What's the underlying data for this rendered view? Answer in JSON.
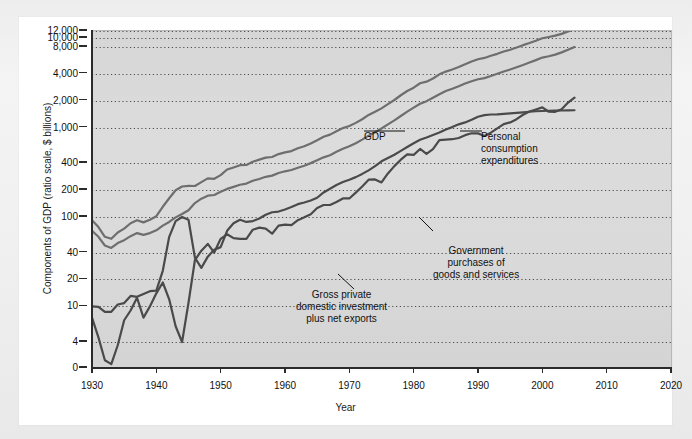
{
  "figure": {
    "y_axis_title": "Components of GDP (ratio scale, $ billions)",
    "x_axis_title": "Year"
  },
  "chart_data": {
    "type": "line",
    "title": "",
    "xlabel": "Year",
    "ylabel": "Components of GDP (ratio scale, $ billions)",
    "scale": "log",
    "grid": true,
    "legend_position": "inline-annotations",
    "xlim": [
      1930,
      2020
    ],
    "xticks": [
      1930,
      1940,
      1950,
      1960,
      1970,
      1980,
      1990,
      2000,
      2010,
      2020
    ],
    "yticks": [
      0,
      4,
      10,
      20,
      40,
      100,
      200,
      400,
      1000,
      2000,
      4000,
      8000,
      10000,
      12000
    ],
    "ytick_labels": [
      "0",
      "4",
      "10",
      "20",
      "40",
      "100",
      "200",
      "400",
      "1,000",
      "2,000",
      "4,000",
      "8,000",
      "10,000",
      "12,000"
    ],
    "series": [
      {
        "name": "GDP",
        "color": "#6e6e6e",
        "label_lines": [
          "GDP"
        ],
        "x": [
          1929,
          1930,
          1931,
          1932,
          1933,
          1934,
          1935,
          1936,
          1937,
          1938,
          1939,
          1940,
          1941,
          1942,
          1943,
          1944,
          1945,
          1946,
          1947,
          1948,
          1949,
          1950,
          1951,
          1952,
          1953,
          1954,
          1955,
          1956,
          1957,
          1958,
          1959,
          1960,
          1961,
          1962,
          1963,
          1964,
          1965,
          1966,
          1967,
          1968,
          1969,
          1970,
          1971,
          1972,
          1973,
          1974,
          1975,
          1976,
          1977,
          1978,
          1979,
          1980,
          1981,
          1982,
          1983,
          1984,
          1985,
          1986,
          1987,
          1988,
          1989,
          1990,
          1991,
          1992,
          1993,
          1994,
          1995,
          1996,
          1997,
          1998,
          1999,
          2000,
          2001,
          2002,
          2003,
          2004,
          2005
        ],
        "y": [
          104,
          92,
          77,
          60,
          57,
          67,
          74,
          85,
          92,
          87,
          93,
          102,
          130,
          162,
          199,
          219,
          223,
          222,
          245,
          270,
          267,
          294,
          339,
          358,
          379,
          381,
          415,
          438,
          461,
          468,
          505,
          527,
          545,
          586,
          618,
          664,
          720,
          788,
          833,
          910,
          985,
          1040,
          1127,
          1238,
          1383,
          1500,
          1638,
          1825,
          2031,
          2295,
          2563,
          2790,
          3128,
          3255,
          3537,
          3933,
          4220,
          4463,
          4740,
          5104,
          5484,
          5803,
          5996,
          6338,
          6667,
          7085,
          7415,
          7839,
          8332,
          8794,
          9354,
          9952,
          10286,
          10642,
          11142,
          11868,
          12638
        ]
      },
      {
        "name": "Personal consumption expenditures",
        "color": "#6e6e6e",
        "label_lines": [
          "Personal",
          "consumption",
          "expenditures"
        ],
        "x": [
          1929,
          1930,
          1931,
          1932,
          1933,
          1934,
          1935,
          1936,
          1937,
          1938,
          1939,
          1940,
          1941,
          1942,
          1943,
          1944,
          1945,
          1946,
          1947,
          1948,
          1949,
          1950,
          1951,
          1952,
          1953,
          1954,
          1955,
          1956,
          1957,
          1958,
          1959,
          1960,
          1961,
          1962,
          1963,
          1964,
          1965,
          1966,
          1967,
          1968,
          1969,
          1970,
          1971,
          1972,
          1973,
          1974,
          1975,
          1976,
          1977,
          1978,
          1979,
          1980,
          1981,
          1982,
          1983,
          1984,
          1985,
          1986,
          1987,
          1988,
          1989,
          1990,
          1991,
          1992,
          1993,
          1994,
          1995,
          1996,
          1997,
          1998,
          1999,
          2000,
          2001,
          2002,
          2003,
          2004,
          2005
        ],
        "y": [
          77,
          70,
          60,
          48,
          45,
          51,
          55,
          61,
          66,
          63,
          66,
          71,
          80,
          88,
          99,
          108,
          119,
          143,
          160,
          173,
          176,
          191,
          206,
          217,
          229,
          236,
          254,
          266,
          281,
          290,
          310,
          324,
          335,
          355,
          374,
          400,
          430,
          464,
          490,
          535,
          578,
          618,
          668,
          732,
          811,
          887,
          976,
          1084,
          1204,
          1346,
          1507,
          1667,
          1842,
          1972,
          2155,
          2349,
          2556,
          2712,
          2890,
          3099,
          3294,
          3465,
          3571,
          3765,
          3989,
          4229,
          4459,
          4717,
          4998,
          5321,
          5672,
          6053,
          6263,
          6530,
          6922,
          7391,
          7961
        ]
      },
      {
        "name": "Gross private domestic investment plus net exports",
        "color": "#4a4a4a",
        "label_lines": [
          "Gross private",
          "domestic investment",
          "plus net exports"
        ],
        "x": [
          1929,
          1930,
          1931,
          1932,
          1933,
          1934,
          1935,
          1936,
          1937,
          1938,
          1939,
          1940,
          1941,
          1942,
          1943,
          1944,
          1945,
          1946,
          1947,
          1948,
          1949,
          1950,
          1951,
          1952,
          1953,
          1954,
          1955,
          1956,
          1957,
          1958,
          1959,
          1960,
          1961,
          1962,
          1963,
          1964,
          1965,
          1966,
          1967,
          1968,
          1969,
          1970,
          1971,
          1972,
          1973,
          1974,
          1975,
          1976,
          1977,
          1978,
          1979,
          1980,
          1981,
          1982,
          1983,
          1984,
          1985,
          1986,
          1987,
          1988,
          1989,
          1990,
          1991,
          1992,
          1993,
          1994,
          1995,
          1996,
          1997,
          1998,
          1999,
          2000,
          2001,
          2002,
          2003,
          2004,
          2005
        ],
        "y": [
          11,
          7.5,
          4.5,
          1.2,
          0.6,
          3.5,
          7.0,
          9.0,
          12.5,
          7.5,
          10.0,
          14.0,
          18.5,
          12.0,
          6.0,
          4.0,
          11.0,
          33.0,
          42.0,
          50.0,
          40.0,
          57.0,
          64.0,
          58.0,
          57.0,
          57.0,
          72.0,
          76.0,
          74.0,
          65.0,
          80.0,
          82.0,
          81.0,
          92.0,
          99.0,
          107.0,
          126.0,
          136.0,
          136.0,
          147.0,
          161.0,
          161.0,
          187.0,
          219.0,
          261.0,
          263.0,
          243.0,
          307.0,
          370.0,
          437.0,
          501.0,
          495.0,
          576.0,
          508.0,
          573.0,
          723.0,
          732.0,
          740.0,
          764.0,
          822.0,
          862.0,
          860.0,
          805.0,
          876.0,
          978.0,
          1090.0,
          1140.0,
          1240.0,
          1389.0,
          1510.0,
          1590.0,
          1679.0,
          1500.0,
          1498.0,
          1600.0,
          1900.0,
          2160.0
        ]
      },
      {
        "name": "Government purchases of goods and services",
        "color": "#4a4a4a",
        "label_lines": [
          "Government",
          "purchases of",
          "goods and services"
        ],
        "x": [
          1929,
          1930,
          1931,
          1932,
          1933,
          1934,
          1935,
          1936,
          1937,
          1938,
          1939,
          1940,
          1941,
          1942,
          1943,
          1944,
          1945,
          1946,
          1947,
          1948,
          1949,
          1950,
          1951,
          1952,
          1953,
          1954,
          1955,
          1956,
          1957,
          1958,
          1959,
          1960,
          1961,
          1962,
          1963,
          1964,
          1965,
          1966,
          1967,
          1968,
          1969,
          1970,
          1971,
          1972,
          1973,
          1974,
          1975,
          1976,
          1977,
          1978,
          1979,
          1980,
          1981,
          1982,
          1983,
          1984,
          1985,
          1986,
          1987,
          1988,
          1989,
          1990,
          1991,
          1992,
          1993,
          1994,
          1995,
          1996,
          1997,
          1998,
          1999,
          2000,
          2001,
          2002,
          2003,
          2004,
          2005
        ],
        "y": [
          9.4,
          10.0,
          9.9,
          8.7,
          8.7,
          10.5,
          10.9,
          13.1,
          12.8,
          13.8,
          14.8,
          15.0,
          25.0,
          60.0,
          90.0,
          100.0,
          93.0,
          35.0,
          27.0,
          36.0,
          43.0,
          46.0,
          70.0,
          85.0,
          93.0,
          88.0,
          90.0,
          96.0,
          106.0,
          113.0,
          115.0,
          121.0,
          129.0,
          139.0,
          145.0,
          153.0,
          164.0,
          188.0,
          207.0,
          228.0,
          246.0,
          261.0,
          279.0,
          303.0,
          332.0,
          370.0,
          419.0,
          456.0,
          496.0,
          548.0,
          605.0,
          668.0,
          730.0,
          775.0,
          827.0,
          880.0,
          951.0,
          1011.0,
          1086.0,
          1140.0,
          1222.0,
          1320.0,
          1376.0,
          1398.0,
          1400.0,
          1420.0,
          1440.0,
          1460.0,
          1480.0,
          1500.0,
          1520.0,
          1530.0,
          1540.0,
          1545.0,
          1550.0,
          1555.0,
          1560.0
        ]
      }
    ]
  },
  "annotations": [
    {
      "id": "gdp",
      "text": "GDP"
    },
    {
      "id": "pce",
      "text": "Personal\nconsumption\nexpenditures"
    },
    {
      "id": "government",
      "text": "Government\npurchases of\ngoods and services"
    },
    {
      "id": "investment",
      "text": "Gross private\ndomestic investment\nplus net exports"
    }
  ],
  "colors": {
    "plot_background": "#d9d9d9",
    "card_background": "#ffffff",
    "page_background": "#f0f0f0",
    "axis": "#2b2b2b",
    "gridline": "#4d4d4d",
    "series_light": "#6e6e6e",
    "series_dark": "#4a4a4a",
    "text": "#111111"
  }
}
